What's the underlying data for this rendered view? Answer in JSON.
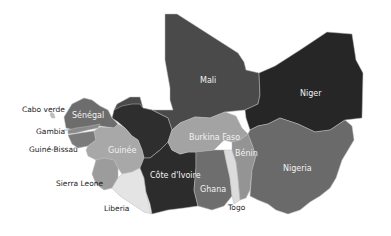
{
  "map": {
    "title": "",
    "region": "West Africa",
    "countries": [
      {
        "name": "Mali",
        "fill": "#4a4a4a"
      },
      {
        "name": "Niger",
        "fill": "#262626"
      },
      {
        "name": "Mauritania-region",
        "fill": "#2e2e2e"
      },
      {
        "name": "Sénégal",
        "fill": "#6d6d6d"
      },
      {
        "name": "Gambia",
        "fill": "#8a8a8a"
      },
      {
        "name": "Guiné-Bissau",
        "fill": "#7a7a7a"
      },
      {
        "name": "Guinée",
        "fill": "#a8a8a8"
      },
      {
        "name": "Sierra Leone",
        "fill": "#9c9c9c"
      },
      {
        "name": "Liberia",
        "fill": "#e4e4e4"
      },
      {
        "name": "Côte d'Ivoire",
        "fill": "#2c2c2c"
      },
      {
        "name": "Burkina Faso",
        "fill": "#a3a3a3"
      },
      {
        "name": "Ghana",
        "fill": "#6e6e6e"
      },
      {
        "name": "Togo",
        "fill": "#dcdcdc"
      },
      {
        "name": "Bénin",
        "fill": "#949494"
      },
      {
        "name": "Nigeria",
        "fill": "#6a6a6a"
      },
      {
        "name": "Cabo verde",
        "fill": "#bdbdbd"
      }
    ],
    "labels": {
      "mali": "Mali",
      "niger": "Niger",
      "senegal": "Sénégal",
      "guinee": "Guinée",
      "burkina_faso": "Burkina Faso",
      "benin": "Bénin",
      "nigeria": "Nigeria",
      "cote_divoire": "Côte d'Ivoire",
      "ghana": "Ghana",
      "cabo_verde": "Cabo verde",
      "gambia": "Gambia",
      "guine_bissau": "Guiné-Bissau",
      "sierra_leone": "Sierra Leone",
      "liberia": "Liberia",
      "togo": "Togo"
    }
  }
}
